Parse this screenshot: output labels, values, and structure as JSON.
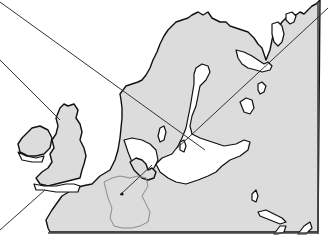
{
  "map": {
    "region": "Northern Europe",
    "areas": [
      "Scandinavia",
      "Finland",
      "Baltic Sea",
      "British Isles",
      "Ireland",
      "Denmark",
      "Germany",
      "Baltic states"
    ],
    "colors": {
      "land": "#dcdcdc",
      "water": "#ffffff",
      "outline": "#111111",
      "highlight_border": "#8a8a8a",
      "leader_line": "#333333"
    },
    "leader_lines": [
      {
        "from": [
          0,
          2
        ],
        "to": [
          205,
          150
        ]
      },
      {
        "from": [
          0,
          60
        ],
        "to": [
          60,
          120
        ]
      },
      {
        "from": [
          0,
          230
        ],
        "to": [
          45,
          190
        ]
      },
      {
        "from": [
          120,
          195
        ],
        "to": [
          152,
          165
        ]
      },
      {
        "from": [
          175,
          150
        ],
        "to": [
          328,
          8
        ]
      }
    ],
    "marker": {
      "label": "",
      "x": 122,
      "y": 194
    }
  }
}
